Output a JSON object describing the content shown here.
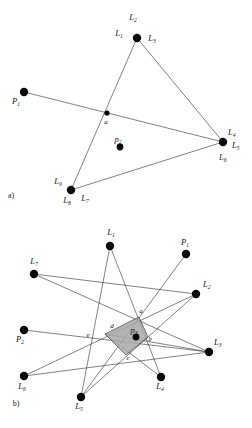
{
  "figure": {
    "type": "geometric-diagram",
    "background": "#ffffff",
    "ink_color": "#111111",
    "shade_color": "#a8a8a8",
    "width": 252,
    "height": 428
  },
  "panel_a": {
    "caption": "a)",
    "caption_pos": [
      11,
      198
    ],
    "nodes": [
      {
        "id": "top",
        "cx": 137,
        "cy": 38,
        "r": 4.2
      },
      {
        "id": "right",
        "cx": 223,
        "cy": 142,
        "r": 4.2
      },
      {
        "id": "bottom",
        "cx": 71,
        "cy": 190,
        "r": 4.2
      },
      {
        "id": "left",
        "cx": 24,
        "cy": 92,
        "r": 4.2
      },
      {
        "id": "a",
        "cx": 107,
        "cy": 113,
        "r": 2.6
      },
      {
        "id": "p2",
        "cx": 120,
        "cy": 147,
        "r": 3.4
      }
    ],
    "labels": [
      {
        "text": "L",
        "sub": "2",
        "x": 133,
        "y": 20,
        "anchor": "middle"
      },
      {
        "text": "L",
        "sub": "1",
        "x": 119,
        "y": 36,
        "anchor": "middle"
      },
      {
        "text": "L",
        "sub": "3",
        "x": 152,
        "y": 41,
        "anchor": "middle"
      },
      {
        "text": "L",
        "sub": "4",
        "x": 228,
        "y": 135,
        "anchor": "start"
      },
      {
        "text": "L",
        "sub": "5",
        "x": 232,
        "y": 148,
        "anchor": "start"
      },
      {
        "text": "L",
        "sub": "6",
        "x": 219,
        "y": 160,
        "anchor": "start"
      },
      {
        "text": "L",
        "sub": "9",
        "x": 58,
        "y": 184,
        "anchor": "middle"
      },
      {
        "text": "L",
        "sub": "8",
        "x": 67,
        "y": 203,
        "anchor": "middle"
      },
      {
        "text": "L",
        "sub": "7",
        "x": 85,
        "y": 201,
        "anchor": "middle"
      },
      {
        "text": "P",
        "sub": "1",
        "x": 16,
        "y": 104,
        "anchor": "middle"
      },
      {
        "text": "p",
        "sub": "2",
        "x": 118,
        "y": 142,
        "anchor": "middle"
      }
    ],
    "plain_labels": [
      {
        "text": "a",
        "x": 106,
        "y": 124
      }
    ],
    "edges": [
      {
        "from": [
          24,
          92
        ],
        "to": [
          223,
          142
        ]
      },
      {
        "from": [
          137,
          38
        ],
        "to": [
          223,
          142
        ]
      },
      {
        "from": [
          137,
          38
        ],
        "to": [
          71,
          190
        ]
      },
      {
        "from": [
          71,
          190
        ],
        "to": [
          223,
          142
        ]
      }
    ]
  },
  "panel_b": {
    "caption": "b)",
    "caption_pos": [
      16,
      406
    ],
    "nodes": [
      {
        "id": "L1",
        "cx": 110,
        "cy": 246,
        "r": 4.2
      },
      {
        "id": "L7",
        "cx": 34,
        "cy": 274,
        "r": 4.2
      },
      {
        "id": "P1",
        "cx": 186,
        "cy": 254,
        "r": 4.2
      },
      {
        "id": "L2",
        "cx": 196,
        "cy": 294,
        "r": 4.2
      },
      {
        "id": "P2",
        "cx": 24,
        "cy": 330,
        "r": 4.2
      },
      {
        "id": "L3",
        "cx": 209,
        "cy": 352,
        "r": 4.2
      },
      {
        "id": "L6",
        "cx": 24,
        "cy": 376,
        "r": 4.2
      },
      {
        "id": "L4",
        "cx": 161,
        "cy": 377,
        "r": 4.2
      },
      {
        "id": "L5",
        "cx": 81,
        "cy": 397,
        "r": 4.2
      },
      {
        "id": "p3",
        "cx": 136,
        "cy": 337,
        "r": 3.4
      }
    ],
    "labels": [
      {
        "text": "L",
        "sub": "1",
        "x": 111,
        "y": 235,
        "anchor": "middle"
      },
      {
        "text": "L",
        "sub": "7",
        "x": 34,
        "y": 264,
        "anchor": "middle"
      },
      {
        "text": "P",
        "sub": "1",
        "x": 185,
        "y": 245,
        "anchor": "middle"
      },
      {
        "text": "L",
        "sub": "2",
        "x": 203,
        "y": 287,
        "anchor": "start"
      },
      {
        "text": "P",
        "sub": "2",
        "x": 20,
        "y": 342,
        "anchor": "middle"
      },
      {
        "text": "L",
        "sub": "3",
        "x": 214,
        "y": 345,
        "anchor": "start"
      },
      {
        "text": "L",
        "sub": "6",
        "x": 22,
        "y": 389,
        "anchor": "middle"
      },
      {
        "text": "L",
        "sub": "4",
        "x": 160,
        "y": 389,
        "anchor": "middle"
      },
      {
        "text": "L",
        "sub": "5",
        "x": 79,
        "y": 409,
        "anchor": "middle"
      },
      {
        "text": "p",
        "sub": "3",
        "x": 134,
        "y": 333,
        "anchor": "middle"
      }
    ],
    "plain_labels": [
      {
        "text": "a",
        "x": 141,
        "y": 313
      },
      {
        "text": "b",
        "x": 150,
        "y": 341
      },
      {
        "text": "c",
        "x": 128,
        "y": 360
      },
      {
        "text": "d",
        "x": 112,
        "y": 328
      },
      {
        "text": "e",
        "x": 88,
        "y": 337
      }
    ],
    "shaded_polygon": [
      [
        139,
        317
      ],
      [
        148,
        337
      ],
      [
        126,
        355
      ],
      [
        105,
        334
      ]
    ],
    "edges": [
      {
        "from": [
          110,
          246
        ],
        "to": [
          81,
          397
        ]
      },
      {
        "from": [
          110,
          246
        ],
        "to": [
          161,
          377
        ]
      },
      {
        "from": [
          34,
          274
        ],
        "to": [
          209,
          352
        ]
      },
      {
        "from": [
          34,
          274
        ],
        "to": [
          196,
          294
        ]
      },
      {
        "from": [
          186,
          254
        ],
        "to": [
          81,
          397
        ]
      },
      {
        "from": [
          196,
          294
        ],
        "to": [
          81,
          397
        ]
      },
      {
        "from": [
          24,
          330
        ],
        "to": [
          209,
          352
        ]
      },
      {
        "from": [
          24,
          376
        ],
        "to": [
          196,
          294
        ]
      },
      {
        "from": [
          24,
          376
        ],
        "to": [
          209,
          352
        ]
      },
      {
        "from": [
          161,
          377
        ],
        "to": [
          105,
          334
        ]
      },
      {
        "from": [
          209,
          352
        ],
        "to": [
          105,
          334
        ]
      }
    ]
  }
}
